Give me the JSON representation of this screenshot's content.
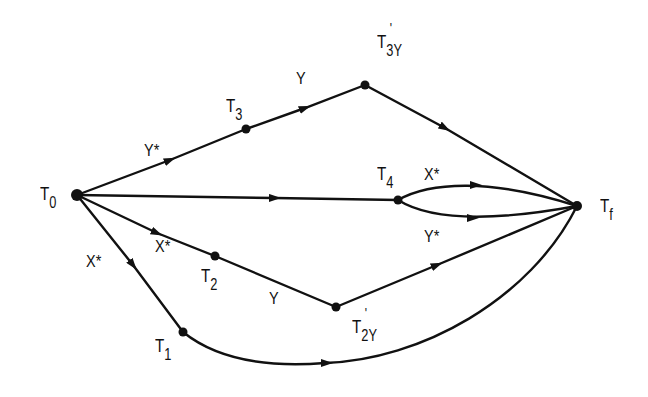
{
  "diagram": {
    "type": "state-transition-graph",
    "line_color": "#111111",
    "background": "#ffffff",
    "nodes": [
      {
        "id": "T0",
        "main": "T",
        "sub": "0",
        "prime": "",
        "x": 77,
        "y": 195
      },
      {
        "id": "T3",
        "main": "T",
        "sub": "3",
        "prime": "",
        "x": 246,
        "y": 129
      },
      {
        "id": "T3Y'",
        "main": "T",
        "sub": "3Y",
        "prime": "'",
        "x": 365,
        "y": 85
      },
      {
        "id": "T4",
        "main": "T",
        "sub": "4",
        "prime": "",
        "x": 398,
        "y": 200
      },
      {
        "id": "Tf",
        "main": "T",
        "sub": "f",
        "prime": "",
        "x": 577,
        "y": 206
      },
      {
        "id": "T2",
        "main": "T",
        "sub": "2",
        "prime": "",
        "x": 215,
        "y": 256
      },
      {
        "id": "T2Y'",
        "main": "T",
        "sub": "2Y",
        "prime": "'",
        "x": 336,
        "y": 307
      },
      {
        "id": "T1",
        "main": "T",
        "sub": "1",
        "prime": "",
        "x": 183,
        "y": 332
      }
    ],
    "edges": [
      {
        "from": "T0",
        "to": "T3",
        "label": "Y*"
      },
      {
        "from": "T3",
        "to": "T3Y'",
        "label": "Y"
      },
      {
        "from": "T3Y'",
        "to": "Tf",
        "label": ""
      },
      {
        "from": "T0",
        "to": "T4",
        "label": ""
      },
      {
        "from": "T4",
        "to": "Tf",
        "label": "X*"
      },
      {
        "from": "T4",
        "to": "Tf",
        "label": "Y*"
      },
      {
        "from": "T0",
        "to": "T2",
        "label": "X*"
      },
      {
        "from": "T2",
        "to": "T2Y'",
        "label": "Y"
      },
      {
        "from": "T2Y'",
        "to": "Tf",
        "label": ""
      },
      {
        "from": "T0",
        "to": "T1",
        "label": "X*"
      },
      {
        "from": "T1",
        "to": "Tf",
        "label": ""
      }
    ]
  },
  "labels": {
    "t0": {
      "main": "T",
      "sub": "0"
    },
    "t3": {
      "main": "T",
      "sub": "3"
    },
    "t3y": {
      "main": "T",
      "sub": "3Y",
      "prime": "'"
    },
    "t4": {
      "main": "T",
      "sub": "4"
    },
    "tf": {
      "main": "T",
      "sub": "f"
    },
    "t2": {
      "main": "T",
      "sub": "2"
    },
    "t2y": {
      "main": "T",
      "sub": "2Y",
      "prime": "'"
    },
    "t1": {
      "main": "T",
      "sub": "1"
    },
    "edge_t0_t3": "Y*",
    "edge_t3_t3y": "Y",
    "edge_t4_tf_upper": "X*",
    "edge_t4_tf_lower": "Y*",
    "edge_t0_t2": "X*",
    "edge_t2_t2y": "Y",
    "edge_t0_t1": "X*"
  }
}
